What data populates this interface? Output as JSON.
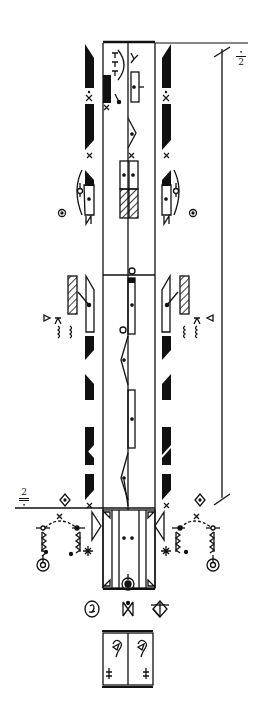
{
  "document": {
    "type": "Labanotation dance score",
    "colors": {
      "ink": "#111111",
      "paper": "#ffffff"
    }
  },
  "annotations": {
    "top_right_marker": "2",
    "bottom_left_marker": "2",
    "right_brace_label": "",
    "measure_count": 2
  },
  "staff": {
    "columns": [
      "left-support",
      "center",
      "right-support"
    ],
    "start_bar": "double",
    "end_bar": "double"
  },
  "symbols": {
    "left_column_directions": [
      "forward-low",
      "x-contact",
      "forward-low",
      "x-contact",
      "forward-low",
      "place-low",
      "x-contact",
      "forward-low",
      "x-contact",
      "forward-low"
    ],
    "right_column_directions": [
      "forward-low",
      "x-contact",
      "forward-low",
      "x-contact",
      "forward-low",
      "place-low",
      "x-contact",
      "forward-low",
      "x-contact",
      "forward-low"
    ],
    "center_symbols": [
      "forward-middle",
      "side-middle",
      "place-high-hatched",
      "hold-circle",
      "forward-middle",
      "side-middle",
      "forward-middle",
      "side-middle"
    ],
    "prefix_glyphs": [
      "circle-dot-left",
      "circle-dot-right",
      "hatched-rect-left",
      "hatched-rect-right",
      "diamond-dot-left",
      "diamond-dot-right"
    ]
  },
  "starting_position": {
    "glyphs": [
      "spiral-circle",
      "bow-tie",
      "divided-diamond"
    ],
    "box_symbols": [
      "ear-hook-left",
      "ear-hook-right"
    ],
    "box_marks": [
      "double-cross",
      "double-cross"
    ]
  }
}
